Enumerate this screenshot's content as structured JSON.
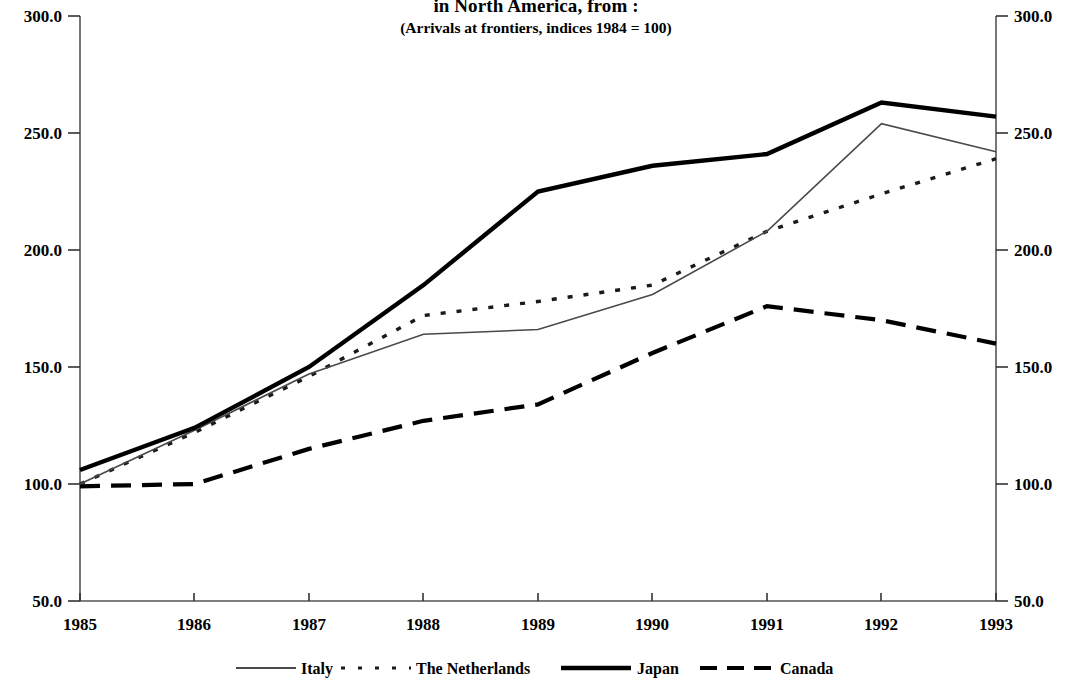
{
  "chart_data": {
    "type": "line",
    "title": "in North America, from :",
    "subtitle": "(Arrivals at frontiers, indices 1984 = 100)",
    "xlabel": "",
    "ylabel": "",
    "ylim": [
      50.0,
      300.0
    ],
    "ytick_labels": [
      "300.0",
      "250.0",
      "200.0",
      "150.0",
      "100.0",
      "50.0"
    ],
    "ytick_values": [
      300.0,
      250.0,
      200.0,
      150.0,
      100.0,
      50.0
    ],
    "right_axis_tick_labels": [
      "300.0",
      "250.0",
      "200.0",
      "150.0",
      "100.0",
      "50.0"
    ],
    "categories": [
      "1985",
      "1986",
      "1987",
      "1988",
      "1989",
      "1990",
      "1991",
      "1992",
      "1993"
    ],
    "x": [
      1985,
      1986,
      1987,
      1988,
      1989,
      1990,
      1991,
      1992,
      1993
    ],
    "grid": false,
    "legend_position": "bottom",
    "series": [
      {
        "name": "Italy",
        "style": "solid-thin",
        "values": [
          100.0,
          123.0,
          147.0,
          164.0,
          166.0,
          181.0,
          208.0,
          254.0,
          242.0
        ]
      },
      {
        "name": "The Netherlands",
        "style": "dotted",
        "values": [
          100.0,
          122.0,
          146.0,
          172.0,
          178.0,
          185.0,
          208.0,
          224.0,
          239.0
        ]
      },
      {
        "name": "Japan",
        "style": "solid-thick",
        "values": [
          106.0,
          124.0,
          150.0,
          185.0,
          225.0,
          236.0,
          241.0,
          263.0,
          257.0
        ]
      },
      {
        "name": "Canada",
        "style": "dashed-thick",
        "values": [
          99.0,
          100.0,
          115.0,
          127.0,
          134.0,
          156.0,
          176.0,
          170.0,
          160.0
        ]
      }
    ]
  },
  "legend": {
    "entries": [
      {
        "label": "Italy",
        "style": "solid-thin"
      },
      {
        "label": "The Netherlands",
        "style": "dotted"
      },
      {
        "label": "Japan",
        "style": "solid-thick"
      },
      {
        "label": "Canada",
        "style": "dashed-thick"
      }
    ]
  }
}
